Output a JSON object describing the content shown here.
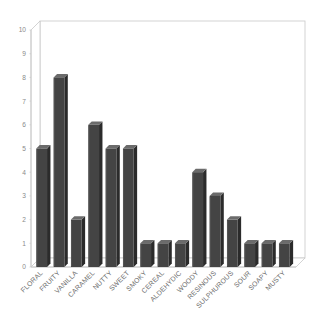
{
  "chart_data": {
    "type": "bar",
    "title": "",
    "subtitle": "",
    "xlabel": "",
    "ylabel": "",
    "ylim": [
      0,
      10
    ],
    "ytick_step": 1,
    "yticks": [
      "0",
      "1",
      "2",
      "3",
      "4",
      "5",
      "6",
      "7",
      "8",
      "9",
      "10"
    ],
    "grid": false,
    "legend": false,
    "legend_position": "none",
    "style": "3d-column",
    "label_rotation_degrees": -45,
    "categories": [
      "FLORAL",
      "FRUITY",
      "VANILLA",
      "CARAMEL",
      "NUTTY",
      "SWEET",
      "SMOKY",
      "CEREAL",
      "ALDEHYDIC",
      "WOODY",
      "RESINOUS",
      "SULPHUROUS",
      "SOUR",
      "SOAPY",
      "MUSTY"
    ],
    "values": [
      5,
      8,
      2,
      6,
      5,
      5,
      1,
      1,
      1,
      4,
      3,
      2,
      1,
      1,
      1
    ],
    "colors": {
      "bar_front": "#444444",
      "bar_top": "#6b6b6b",
      "bar_side": "#2b2b2b",
      "axis_line": "#c8c8c8",
      "plot_background": "#ffffff",
      "tick_text": "#8a8a8a",
      "category_text": "#6d6d6d"
    }
  }
}
